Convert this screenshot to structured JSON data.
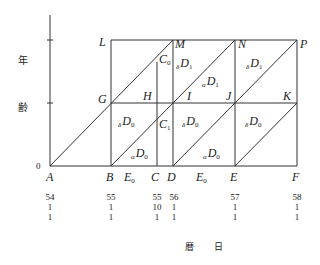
{
  "axes": {
    "y_label_1": "年",
    "y_label_2": "齢",
    "x_label_1": "暦",
    "x_label_2": "日",
    "origin": "0"
  },
  "points": {
    "A": "A",
    "B": "B",
    "C": "C",
    "D": "D",
    "E": "E",
    "F": "F",
    "G": "G",
    "H": "H",
    "I": "I",
    "J": "J",
    "K": "K",
    "L": "L",
    "M": "M",
    "N": "N",
    "P": "P"
  },
  "regions": {
    "c0": {
      "main": "C",
      "sub": "0"
    },
    "c1": {
      "main": "C",
      "sub": "1"
    },
    "e0_left": {
      "main": "E",
      "sub": "0"
    },
    "e0_right": {
      "main": "E",
      "sub": "0"
    },
    "delta_d0_1": {
      "pre": "δ",
      "main": "D",
      "sub": "0"
    },
    "alpha_d0_1": {
      "pre": "α",
      "main": "D",
      "sub": "0"
    },
    "delta_d0_2": {
      "pre": "δ",
      "main": "D",
      "sub": "0"
    },
    "alpha_d0_2": {
      "pre": "α",
      "main": "D",
      "sub": "0"
    },
    "delta_d0_3": {
      "pre": "δ",
      "main": "D",
      "sub": "0"
    },
    "delta_d1_1": {
      "pre": "δ",
      "main": "D",
      "sub": "1"
    },
    "alpha_d1": {
      "pre": "α",
      "main": "D",
      "sub": "1"
    },
    "delta_d1_2": {
      "pre": "δ",
      "main": "D",
      "sub": "1"
    }
  },
  "dates": [
    {
      "year": "54",
      "month": "1",
      "day": "1"
    },
    {
      "year": "55",
      "month": "1",
      "day": "1"
    },
    {
      "year": "55",
      "month": "10",
      "day": "1"
    },
    {
      "year": "56",
      "month": "1",
      "day": "1"
    },
    {
      "year": "57",
      "month": "1",
      "day": "1"
    },
    {
      "year": "58",
      "month": "1",
      "day": "1"
    }
  ]
}
